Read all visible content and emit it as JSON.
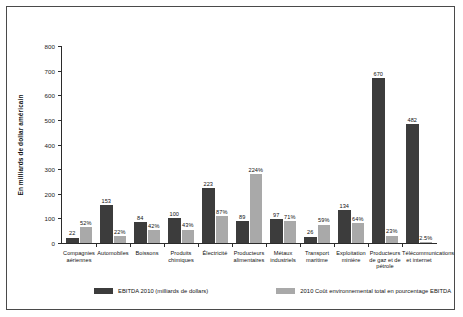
{
  "chart_data": {
    "type": "bar",
    "title": "",
    "xlabel": "",
    "ylabel": "En milliards de dollar américain",
    "ylim": [
      0,
      800
    ],
    "yticks": [
      "0",
      "100",
      "200",
      "300",
      "400",
      "500",
      "600",
      "700",
      "800"
    ],
    "grid": false,
    "legend_position": "bottom",
    "categories": [
      "Compagnies aériennes",
      "Automobiles",
      "Boissons",
      "Produits chimiques",
      "Électricité",
      "Producteurs alimentaires",
      "Métaux industriels",
      "Transport maritime",
      "Exploitation minière",
      "Producteurs de gaz et de pétrole",
      "Télécommunications et internet"
    ],
    "series": [
      {
        "name": "EBITDA 2010 (milliards de dollars)",
        "color": "#3c3c3c",
        "values": [
          22,
          153,
          84,
          100,
          223,
          89,
          97,
          26,
          134,
          670,
          482
        ],
        "labels": [
          "22",
          "153",
          "84",
          "100",
          "223",
          "89",
          "97",
          "26",
          "134",
          "670",
          "482"
        ]
      },
      {
        "name": "2010 Coût environnemental total en pourcentage EBITDA",
        "color": "#a9a9a9",
        "values": [
          52,
          22,
          42,
          43,
          87,
          224,
          71,
          59,
          64,
          23,
          2.5
        ],
        "labels": [
          "52%",
          "22%",
          "42%",
          "43%",
          "87%",
          "224%",
          "71%",
          "59%",
          "64%",
          "23%",
          "2.5%"
        ]
      }
    ]
  },
  "legend": {
    "items": [
      {
        "label": "EBITDA 2010 (milliards de dollars)"
      },
      {
        "label": "2010 Coût environnemental total en pourcentage EBITDA"
      }
    ]
  },
  "axis": {
    "ylabel": "En milliards de dollar américain"
  }
}
